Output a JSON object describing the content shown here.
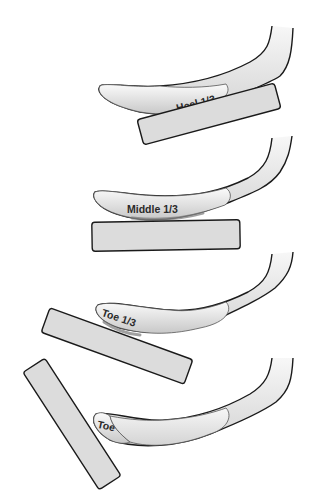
{
  "figures": [
    {
      "id": "heel",
      "label": "Heel 1/3"
    },
    {
      "id": "middle",
      "label": "Middle 1/3"
    },
    {
      "id": "toe-third",
      "label": "Toe 1/3"
    },
    {
      "id": "toe",
      "label": "Toe"
    }
  ],
  "colors": {
    "outline": "#1a1a1a",
    "blade_fill": "#e6e6e6",
    "block_fill": "#dcdcdc",
    "background": "#ffffff"
  }
}
